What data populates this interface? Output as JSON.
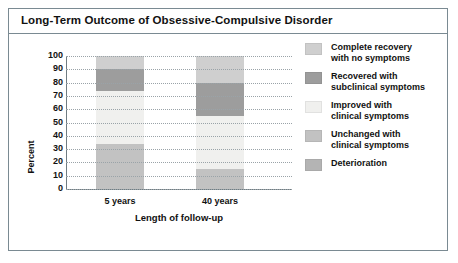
{
  "figure": {
    "title": "Long-Term Outcome of Obsessive-Compulsive Disorder"
  },
  "chart_data": {
    "type": "bar",
    "subtype": "stacked-bar",
    "title": "Long-Term Outcome of Obsessive-Compulsive Disorder",
    "xlabel": "Length of follow-up",
    "ylabel": "Percent",
    "categories": [
      "5 years",
      "40 years"
    ],
    "ylim": [
      0,
      100
    ],
    "yticks": [
      100,
      90,
      80,
      70,
      60,
      50,
      40,
      30,
      20,
      10,
      0
    ],
    "grid": true,
    "legend_position": "right",
    "series": [
      {
        "name": "Complete recovery with no symptoms",
        "color": "#cfcfcf",
        "values": [
          10,
          20
        ]
      },
      {
        "name": "Recovered with subclinical symptoms",
        "color": "#9d9d9d",
        "values": [
          16,
          25
        ]
      },
      {
        "name": "Improved with clinical symptoms",
        "color": "#f0f0ee",
        "values": [
          40,
          40
        ]
      },
      {
        "name": "Unchanged with clinical symptoms",
        "color": "#c2c2c2",
        "values": [
          34,
          15
        ]
      },
      {
        "name": "Deterioration",
        "color": "#b4b4b4",
        "values": [
          0,
          0
        ]
      }
    ]
  },
  "legend": {
    "items": [
      {
        "label": "Complete recovery\nwith no symptoms",
        "color": "#cfcfcf"
      },
      {
        "label": "Recovered with\nsubclinical symptoms",
        "color": "#9d9d9d"
      },
      {
        "label": "Improved with\nclinical symptoms",
        "color": "#f0f0ee"
      },
      {
        "label": "Unchanged with\nclinical symptoms",
        "color": "#c2c2c2"
      },
      {
        "label": "Deterioration",
        "color": "#b4b4b4"
      }
    ]
  }
}
